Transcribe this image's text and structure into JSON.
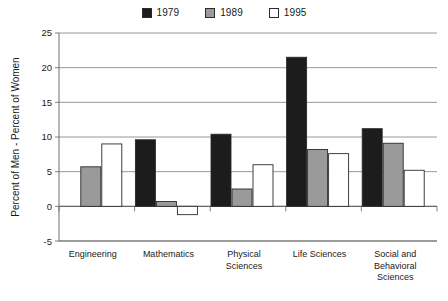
{
  "chart_data": {
    "type": "bar",
    "title": "",
    "subtitle": "",
    "xlabel": "",
    "ylabel": "Percent of Men - Percent of Women",
    "categories": [
      "Engineering",
      "Mathematics",
      "Physical Sciences",
      "Life Sciences",
      "Social and Behavioral Sciences"
    ],
    "category_label_lines": [
      [
        "Engineering"
      ],
      [
        "Mathematics"
      ],
      [
        "Physical",
        "Sciences"
      ],
      [
        "Life Sciences"
      ],
      [
        "Social and",
        "Behavioral",
        "Sciences"
      ]
    ],
    "series": [
      {
        "name": "1979",
        "color": "#1c1c1c",
        "values": [
          null,
          9.6,
          10.4,
          21.5,
          11.2
        ]
      },
      {
        "name": "1989",
        "color": "#9a9a9a",
        "values": [
          5.7,
          0.7,
          2.5,
          8.2,
          9.1
        ]
      },
      {
        "name": "1995",
        "color": "#ffffff",
        "values": [
          9.0,
          -1.2,
          6.0,
          7.6,
          5.2
        ]
      }
    ],
    "ylim": [
      -5,
      25
    ],
    "yticks": [
      25,
      20,
      15,
      10,
      5,
      0,
      -5
    ],
    "ytick_labels": [
      "25",
      "20",
      "15",
      "10",
      "5",
      "0",
      "-5"
    ],
    "grid": true,
    "grid_axis": "y",
    "legend_position": "top-center",
    "bar_edge_color": "#2b2b2b",
    "axis_color": "#6f6f6f",
    "grid_color": "#8d8d8d"
  },
  "legend": {
    "items": [
      {
        "label": "1979",
        "swatch_name": "legend-swatch-1979"
      },
      {
        "label": "1989",
        "swatch_name": "legend-swatch-1989"
      },
      {
        "label": "1995",
        "swatch_name": "legend-swatch-1995"
      }
    ]
  },
  "axes": {
    "y_axis_title": "Percent of Men - Percent of Women",
    "y_tick_labels": [
      "25",
      "20",
      "15",
      "10",
      "5",
      "0",
      "-5"
    ],
    "x_tick_labels": [
      "Engineering",
      "Mathematics",
      "Physical Sciences",
      "Life Sciences",
      "Social and Behavioral Sciences"
    ]
  }
}
